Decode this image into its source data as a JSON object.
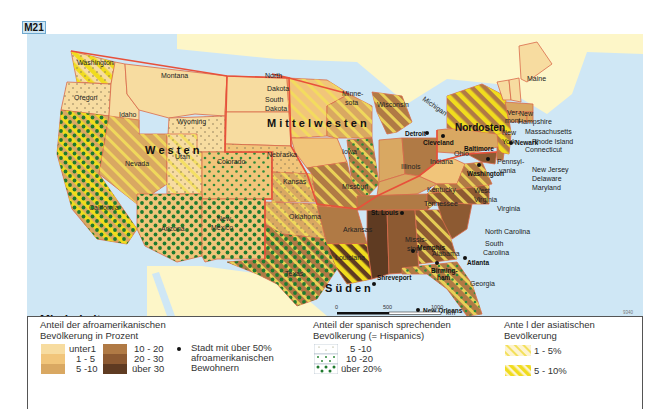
{
  "figure_label": "M21",
  "map": {
    "title": "Minderheiten",
    "subtitle": "(2000)",
    "code": "9340",
    "scale": {
      "ticks": [
        "0",
        "500",
        "1000"
      ],
      "unit": "km"
    },
    "regions": [
      {
        "name": "Westen",
        "label": "W e s t e n"
      },
      {
        "name": "Mittelwesten",
        "label": "M i t t e l w e s t e n"
      },
      {
        "name": "Süden",
        "label": "S ü d e n"
      },
      {
        "name": "Nordosten",
        "label": "Nordosten"
      }
    ],
    "states": [
      {
        "name": "Washington",
        "african_american": "unter 1",
        "hispanic": "5 - 10",
        "asian": "5 - 10%"
      },
      {
        "name": "Oregon",
        "african_american": "unter 1",
        "hispanic": "5 - 10",
        "asian": ""
      },
      {
        "name": "Idaho",
        "african_american": "unter 1",
        "hispanic": "",
        "asian": ""
      },
      {
        "name": "Montana",
        "african_american": "unter 1",
        "hispanic": "",
        "asian": ""
      },
      {
        "name": "Wyoming",
        "african_american": "unter 1",
        "hispanic": "5 - 10",
        "asian": ""
      },
      {
        "name": "California",
        "african_american": "5 - 10",
        "hispanic": "über 20%",
        "asian": "5 - 10%"
      },
      {
        "name": "Nevada",
        "african_american": "5 - 10",
        "hispanic": "",
        "asian": "1 - 5%"
      },
      {
        "name": "Utah",
        "african_american": "unter 1",
        "hispanic": "5 - 10",
        "asian": "1 - 5%"
      },
      {
        "name": "Colorado",
        "african_american": "1 - 5",
        "hispanic": "10 - 20",
        "asian": ""
      },
      {
        "name": "Arizona",
        "african_american": "1 - 5",
        "hispanic": "über 20%",
        "asian": ""
      },
      {
        "name": "New Mexico",
        "african_american": "1 - 5",
        "hispanic": "über 20%",
        "asian": ""
      },
      {
        "name": "North Dakota",
        "african_american": "unter 1",
        "hispanic": "",
        "asian": ""
      },
      {
        "name": "South Dakota",
        "african_american": "unter 1",
        "hispanic": "",
        "asian": ""
      },
      {
        "name": "Nebraska",
        "african_american": "1 - 5",
        "hispanic": "5 - 10",
        "asian": ""
      },
      {
        "name": "Kansas",
        "african_american": "5 - 10",
        "hispanic": "5 - 10",
        "asian": "1 - 5%"
      },
      {
        "name": "Minnesota",
        "african_american": "1 - 5",
        "hispanic": "",
        "asian": "1 - 5%"
      },
      {
        "name": "Iowa",
        "african_american": "1 - 5",
        "hispanic": "",
        "asian": ""
      },
      {
        "name": "Wisconsin",
        "african_american": "5 - 10",
        "hispanic": "",
        "asian": "1 - 5%"
      },
      {
        "name": "Illinois",
        "african_american": "10 - 20",
        "hispanic": "10 - 20",
        "asian": "1 - 5%"
      },
      {
        "name": "Michigan",
        "african_american": "10 - 20",
        "hispanic": "",
        "asian": "1 - 5%"
      },
      {
        "name": "Missouri",
        "african_american": "10 - 20",
        "hispanic": "",
        "asian": "1 - 5%"
      },
      {
        "name": "Indiana",
        "african_american": "5 - 10",
        "hispanic": "",
        "asian": ""
      },
      {
        "name": "Ohio",
        "african_american": "10 - 20",
        "hispanic": "",
        "asian": ""
      },
      {
        "name": "Kentucky",
        "african_american": "5 - 10",
        "hispanic": "",
        "asian": ""
      },
      {
        "name": "West Virginia",
        "african_american": "1 - 5",
        "hispanic": "",
        "asian": ""
      },
      {
        "name": "Oklahoma",
        "african_american": "5 - 10",
        "hispanic": "5 - 10",
        "asian": "1 - 5%"
      },
      {
        "name": "Texas",
        "african_american": "10 - 20",
        "hispanic": "über 20%",
        "asian": "1 - 5%"
      },
      {
        "name": "Arkansas",
        "african_american": "10 - 20",
        "hispanic": "",
        "asian": ""
      },
      {
        "name": "Louisiana",
        "african_american": "über 30",
        "hispanic": "",
        "asian": "1 - 5%"
      },
      {
        "name": "Mississippi",
        "african_american": "über 30",
        "hispanic": "",
        "asian": ""
      },
      {
        "name": "Tennessee",
        "african_american": "10 - 20",
        "hispanic": "",
        "asian": ""
      },
      {
        "name": "Alabama",
        "african_american": "20 - 30",
        "hispanic": "",
        "asian": ""
      },
      {
        "name": "Georgia",
        "african_american": "20 - 30",
        "hispanic": "",
        "asian": "1 - 5%"
      },
      {
        "name": "Florida",
        "african_american": "10 - 20",
        "hispanic": "10 - 20",
        "asian": "1 - 5%"
      },
      {
        "name": "South Carolina",
        "african_american": "20 - 30",
        "hispanic": "",
        "asian": ""
      },
      {
        "name": "North Carolina",
        "african_american": "20 - 30",
        "hispanic": "",
        "asian": "1 - 5%"
      },
      {
        "name": "Virginia",
        "african_american": "10 - 20",
        "hispanic": "",
        "asian": "1 - 5%"
      },
      {
        "name": "Maryland",
        "african_american": "20 - 30",
        "hispanic": "",
        "asian": "1 - 5%"
      },
      {
        "name": "Delaware",
        "african_american": "10 - 20",
        "hispanic": "",
        "asian": ""
      },
      {
        "name": "Pennsylvania",
        "african_american": "5 - 10",
        "hispanic": "",
        "asian": ""
      },
      {
        "name": "New Jersey",
        "african_american": "10 - 20",
        "hispanic": "10 - 20",
        "asian": "5 - 10%"
      },
      {
        "name": "New York",
        "african_american": "10 - 20",
        "hispanic": "10 - 20",
        "asian": "5 - 10%"
      },
      {
        "name": "Vermont",
        "african_american": "unter 1",
        "hispanic": "",
        "asian": ""
      },
      {
        "name": "New Hampshire",
        "african_american": "unter 1",
        "hispanic": "",
        "asian": ""
      },
      {
        "name": "Maine",
        "african_american": "unter 1",
        "hispanic": "",
        "asian": ""
      },
      {
        "name": "Massachusetts",
        "african_american": "5 - 10",
        "hispanic": "",
        "asian": ""
      },
      {
        "name": "Rhode Island",
        "african_american": "5 - 10",
        "hispanic": "",
        "asian": ""
      },
      {
        "name": "Connecticut",
        "african_american": "5 - 10",
        "hispanic": "",
        "asian": ""
      }
    ],
    "state_labels": {
      "washington": "Washington",
      "oregon": "Oregon",
      "idaho": "Idaho",
      "montana": "Montana",
      "wyoming": "Wyoming",
      "california": "California",
      "nevada": "Nevada",
      "utah": "Utah",
      "colorado": "Colorado",
      "arizona": "Arizona",
      "new_mexico_1": "New",
      "new_mexico_2": "Mexico",
      "north_dakota_1": "North",
      "north_dakota_2": "Dakota",
      "south_dakota_1": "South",
      "south_dakota_2": "Dakota",
      "nebraska": "Nebraska",
      "kansas": "Kansas",
      "oklahoma": "Oklahoma",
      "texas": "Texas",
      "minnesota_1": "Minne-",
      "minnesota_2": "sota",
      "iowa": "Iowa",
      "missouri": "Missouri",
      "arkansas": "Arkansas",
      "louisiana": "Louisiana",
      "wisconsin": "Wisconsin",
      "illinois": "Illinois",
      "michigan": "Michigan",
      "indiana": "Indiana",
      "ohio": "Ohio",
      "kentucky": "Kentucky",
      "tennessee": "Tennessee",
      "mississippi_1": "Missis-",
      "mississippi_2": "sippi",
      "alabama": "Alabama",
      "georgia": "Georgia",
      "florida": "Florida",
      "south_carolina_1": "South",
      "south_carolina_2": "Carolina",
      "north_carolina": "North Carolina",
      "virginia": "Virginia",
      "west_virginia_1": "West",
      "west_virginia_2": "Virginia",
      "maryland": "Maryland",
      "delaware": "Delaware",
      "new_jersey": "New Jersey",
      "pennsylvania_1": "Pennsyl-",
      "pennsylvania_2": "vania",
      "new_york_1": "New",
      "new_york_2": "York",
      "vermont_1": "Ver-",
      "vermont_2": "mont",
      "new_hampshire_1": "New",
      "new_hampshire_2": "Hampshire",
      "maine": "Maine",
      "massachusetts": "Massachusetts",
      "rhode_island": "Rhode Island",
      "connecticut": "Connecticut"
    },
    "cities": [
      {
        "key": "st_louis",
        "name": "St. Louis"
      },
      {
        "key": "memphis",
        "name": "Memphis"
      },
      {
        "key": "shreveport",
        "name": "Shreveport"
      },
      {
        "key": "new_orleans",
        "name": "New Orleans"
      },
      {
        "key": "birmingham_1",
        "name": "Birming-"
      },
      {
        "key": "birmingham_2",
        "name": "ham"
      },
      {
        "key": "atlanta",
        "name": "Atlanta"
      },
      {
        "key": "detroit",
        "name": "Detroit"
      },
      {
        "key": "cleveland",
        "name": "Cleveland"
      },
      {
        "key": "baltimore",
        "name": "Baltimore"
      },
      {
        "key": "washington_dc",
        "name": "Washington"
      },
      {
        "key": "newark",
        "name": "Newark"
      }
    ]
  },
  "legend": {
    "african_american": {
      "title_1": "Anteil der afroamerikanischen",
      "title_2": "Bevölkerung in Prozent",
      "classes": [
        {
          "label": "unter1",
          "color": "#f7dca0"
        },
        {
          "label": "1 - 5",
          "color": "#f1c57a"
        },
        {
          "label": "5 -10",
          "color": "#d9a862"
        },
        {
          "label": "10 - 20",
          "color": "#b07a45"
        },
        {
          "label": "20 - 30",
          "color": "#8d5a32"
        },
        {
          "label": "über 30",
          "color": "#5f3b22"
        }
      ]
    },
    "city_marker": {
      "line_1": "Stadt mit über 50%",
      "line_2": "afroamerikanischen",
      "line_3": "Bewohnern"
    },
    "hispanic": {
      "title_1": "Anteil der spanisch sprechenden",
      "title_2": "Bevölkerung (= Hispanics)",
      "classes": [
        {
          "label": "5 -10",
          "dot_color": "#8a8a60"
        },
        {
          "label": "10 -20",
          "dot_color": "#2f8a3a"
        },
        {
          "label": "über  20%",
          "dot_color": "#1f7a2e"
        }
      ]
    },
    "asian": {
      "title_1": "Ante l der asiatischen",
      "title_2": "Bevölkerung",
      "classes": [
        {
          "label": "1 - 5%",
          "stripe_color": "#f3e05a"
        },
        {
          "label": "5 - 10%",
          "stripe_color": "#f0dc1e"
        }
      ]
    }
  },
  "colors": {
    "ocean": "#cfe7f5",
    "land_foreign": "#fdf6c8",
    "border_region": "#e8503a",
    "state_border": "#d96a4a"
  }
}
